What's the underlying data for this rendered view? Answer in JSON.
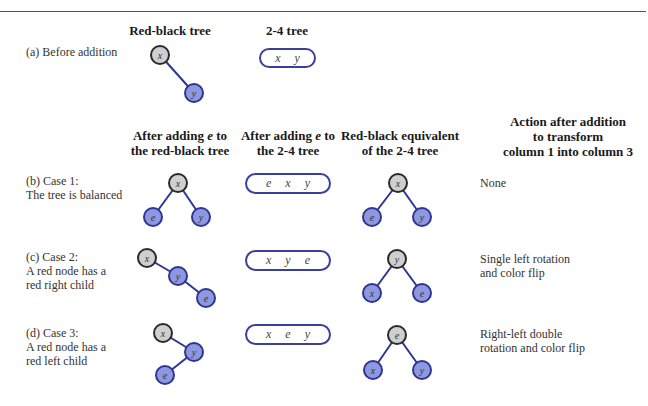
{
  "headers": {
    "red_black_tree": "Red-black tree",
    "two_four_tree": "2-4 tree",
    "col1": {
      "line1_pre": "After adding ",
      "line1_var": "e",
      "line1_post": " to",
      "line2": "the red-black tree"
    },
    "col2": {
      "line1_pre": "After adding ",
      "line1_var": "e",
      "line1_post": " to",
      "line2": "the 2-4 tree"
    },
    "col3": {
      "line1": "Red-black equivalent",
      "line2": "of the 2-4 tree"
    },
    "col4": {
      "line1": "Action after addition",
      "line2": "to transform",
      "line3": "column 1 into column 3"
    }
  },
  "rows": {
    "a": {
      "label_line1": "(a) Before addition",
      "box_keys": [
        "x",
        "y"
      ]
    },
    "b": {
      "label_line1": "(b) Case 1:",
      "label_line2": "The tree is balanced",
      "box_keys": [
        "e",
        "x",
        "y"
      ],
      "action_line1": "None"
    },
    "c": {
      "label_line1": "(c) Case 2:",
      "label_line2": "A red node has a",
      "label_line3": "red right child",
      "box_keys": [
        "x",
        "y",
        "e"
      ],
      "action_line1": "Single left rotation",
      "action_line2": "and color flip"
    },
    "d": {
      "label_line1": "(d) Case 3:",
      "label_line2": "A red node has a",
      "label_line3": "red left child",
      "box_keys": [
        "x",
        "e",
        "y"
      ],
      "action_line1": "Right-left double",
      "action_line2": "rotation and color flip"
    }
  },
  "colors": {
    "black_node_fill": "#cfcfcf",
    "black_node_stroke": "#2a2a2a",
    "red_node_fill": "#8e98e0",
    "red_node_stroke": "#2e3592",
    "edge": "#2e3592",
    "box_border": "#3a3f9a"
  },
  "trees": {
    "a_rb": {
      "nodes": [
        {
          "k": "x",
          "c": "black",
          "x": 160,
          "y": 55
        },
        {
          "k": "y",
          "c": "red",
          "x": 194,
          "y": 93
        }
      ],
      "edges": [
        [
          0,
          1
        ]
      ]
    },
    "b_rb": {
      "nodes": [
        {
          "k": "x",
          "c": "black",
          "x": 178,
          "y": 183
        },
        {
          "k": "e",
          "c": "red",
          "x": 153,
          "y": 217
        },
        {
          "k": "y",
          "c": "red",
          "x": 201,
          "y": 217
        }
      ],
      "edges": [
        [
          0,
          1
        ],
        [
          0,
          2
        ]
      ]
    },
    "b_eq": {
      "nodes": [
        {
          "k": "x",
          "c": "black",
          "x": 398,
          "y": 183
        },
        {
          "k": "e",
          "c": "red",
          "x": 372,
          "y": 217
        },
        {
          "k": "y",
          "c": "red",
          "x": 422,
          "y": 217
        }
      ],
      "edges": [
        [
          0,
          1
        ],
        [
          0,
          2
        ]
      ]
    },
    "c_rb": {
      "nodes": [
        {
          "k": "x",
          "c": "black",
          "x": 147,
          "y": 258
        },
        {
          "k": "y",
          "c": "red",
          "x": 178,
          "y": 276
        },
        {
          "k": "e",
          "c": "red",
          "x": 206,
          "y": 298
        }
      ],
      "edges": [
        [
          0,
          1
        ],
        [
          1,
          2
        ]
      ]
    },
    "c_eq": {
      "nodes": [
        {
          "k": "y",
          "c": "black",
          "x": 397,
          "y": 259
        },
        {
          "k": "x",
          "c": "red",
          "x": 372,
          "y": 293
        },
        {
          "k": "e",
          "c": "red",
          "x": 422,
          "y": 293
        }
      ],
      "edges": [
        [
          0,
          1
        ],
        [
          0,
          2
        ]
      ]
    },
    "d_rb": {
      "nodes": [
        {
          "k": "x",
          "c": "black",
          "x": 163,
          "y": 333
        },
        {
          "k": "y",
          "c": "red",
          "x": 194,
          "y": 352
        },
        {
          "k": "e",
          "c": "red",
          "x": 165,
          "y": 375
        }
      ],
      "edges": [
        [
          0,
          1
        ],
        [
          1,
          2
        ]
      ]
    },
    "d_eq": {
      "nodes": [
        {
          "k": "e",
          "c": "black",
          "x": 397,
          "y": 335
        },
        {
          "k": "x",
          "c": "red",
          "x": 373,
          "y": 370
        },
        {
          "k": "y",
          "c": "red",
          "x": 422,
          "y": 370
        }
      ],
      "edges": [
        [
          0,
          1
        ],
        [
          0,
          2
        ]
      ]
    }
  }
}
